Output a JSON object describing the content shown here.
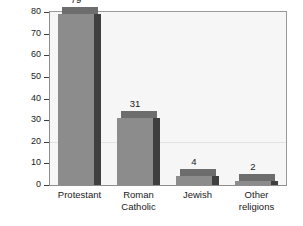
{
  "chart_data": {
    "type": "bar",
    "title": "",
    "xlabel": "",
    "ylabel": "Number (in millions)",
    "categories": [
      "Protestant",
      "Roman Catholic",
      "Jewish",
      "Other religions"
    ],
    "category_lines": [
      [
        "Protestant"
      ],
      [
        "Roman",
        "Catholic"
      ],
      [
        "Jewish"
      ],
      [
        "Other",
        "religions"
      ]
    ],
    "values": [
      79,
      31,
      4,
      2
    ],
    "value_labels": [
      "79",
      "31",
      "4",
      "2"
    ],
    "ylim": [
      0,
      80
    ],
    "ytick_values": [
      0,
      10,
      20,
      30,
      40,
      50,
      60,
      70,
      80
    ],
    "ytick_labels": [
      "0",
      "10",
      "20",
      "30",
      "40",
      "50",
      "60",
      "70",
      "80"
    ],
    "grid": "single faint horizontal line at 20",
    "gridline_values": [
      20
    ],
    "legend": "none",
    "legend_position": "none",
    "style": "3d-shaded vertical bars",
    "colors": {
      "bar_front": "#8c8c8c",
      "bar_side": "#3f3f3f",
      "bar_top": "#6d6d6d",
      "plot_background": "#f6f6f6",
      "plot_border": "#8d8d8d",
      "axis": "#3d3d3d",
      "text": "#1a1a1a",
      "gridline": "#e2e2e2",
      "page_background": "#ffffff"
    }
  }
}
